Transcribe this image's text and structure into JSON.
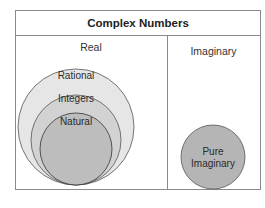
{
  "title": "Complex Numbers",
  "sections": {
    "real": {
      "label": "Real"
    },
    "imaginary": {
      "label": "Imaginary"
    }
  },
  "sets": {
    "rational": {
      "label": "Rational",
      "color": "#e6e6e6"
    },
    "integers": {
      "label": "Integers",
      "color": "#d2d2d2"
    },
    "natural": {
      "label": "Natural",
      "color": "#bdbdbd"
    },
    "pure_imaginary": {
      "label_line1": "Pure",
      "label_line2": "Imaginary",
      "color": "#b5b5b5"
    }
  },
  "colors": {
    "border": "#8a8a8a",
    "circle_stroke": "#555555"
  }
}
